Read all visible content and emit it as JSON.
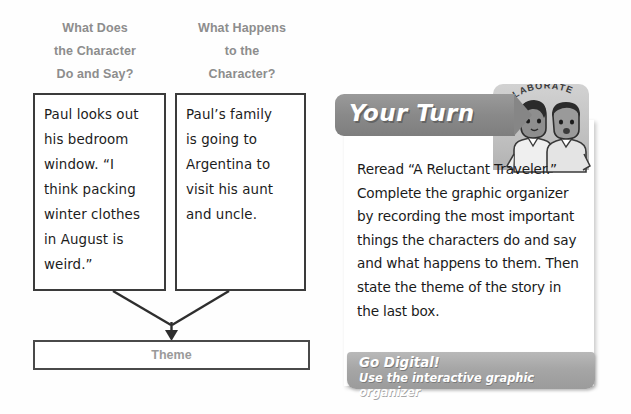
{
  "organizer": {
    "columns": [
      {
        "heading_lines": [
          "What Does",
          "the Character",
          "Do and Say?"
        ],
        "entry_lines": [
          "Paul looks out",
          "his bedroom",
          "window. “I",
          "think packing",
          "winter clothes",
          "in August is",
          "weird.”"
        ]
      },
      {
        "heading_lines": [
          "What Happens",
          "to the",
          "Character?"
        ],
        "entry_lines": [
          "Paul’s family",
          "is going to",
          "Argentina to",
          "visit his aunt",
          "and uncle."
        ]
      }
    ],
    "theme_label": "Theme"
  },
  "your_turn": {
    "title": "Your Turn",
    "collaborate_badge": "COLLABORATE",
    "body": "Reread “A Reluctant Traveler.” Complete the graphic organizer by recording the most important things the characters do and say and what happens to them. Then state the theme of the story in the last box.",
    "go_digital_title": "Go Digital!",
    "go_digital_subtitle": "Use the interactive graphic organizer"
  },
  "colors": {
    "heading_gray": "#8d8d8d",
    "box_border": "#3b3b3b",
    "banner_gray": "#8a8a8a",
    "badge_gray": "#bdbdbd",
    "go_digital_gray": "#a6a6a6",
    "ink": "#1c1c1c"
  }
}
